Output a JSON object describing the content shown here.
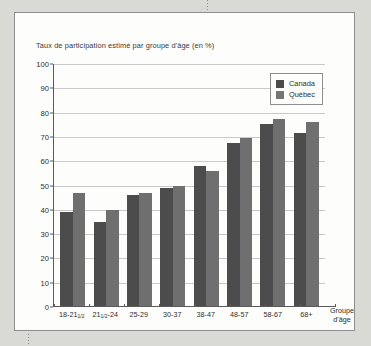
{
  "chart_data": {
    "type": "bar",
    "title": "Taux de participation estimé par groupe d'âge (en %)",
    "xlabel": "Groupe d'âge",
    "xlabel_line1": "Groupe",
    "xlabel_line2": "d'âge",
    "ylabel": "",
    "ylim": [
      0,
      100
    ],
    "ytick_step": 10,
    "yticks": [
      100,
      90,
      80,
      70,
      60,
      50,
      40,
      30,
      20,
      10,
      0
    ],
    "grid": true,
    "legend_position": "top-right",
    "categories": [
      {
        "main": "18-21",
        "sub": "1/2",
        "suffix": ""
      },
      {
        "main": "21",
        "sub": "1/2",
        "suffix": "-24"
      },
      {
        "main": "25-29",
        "sub": "",
        "suffix": ""
      },
      {
        "main": "30-37",
        "sub": "",
        "suffix": ""
      },
      {
        "main": "38-47",
        "sub": "",
        "suffix": ""
      },
      {
        "main": "48-57",
        "sub": "",
        "suffix": ""
      },
      {
        "main": "58-67",
        "sub": "",
        "suffix": ""
      },
      {
        "main": "68+",
        "sub": "",
        "suffix": ""
      }
    ],
    "series": [
      {
        "name": "Canada",
        "color": "#4c4c4c",
        "values": [
          39,
          35,
          46,
          49,
          58,
          67.5,
          75.5,
          71.5
        ]
      },
      {
        "name": "Québec",
        "color": "#6f6f6f",
        "values": [
          47,
          40,
          47,
          50,
          56,
          69.5,
          77.5,
          76
        ]
      }
    ]
  },
  "legend": {
    "items": [
      {
        "label": "Canada",
        "swatch": "canada"
      },
      {
        "label": "Québec",
        "swatch": "quebec"
      }
    ]
  }
}
